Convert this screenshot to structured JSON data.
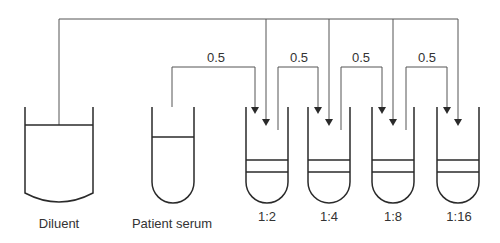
{
  "diagram": {
    "type": "serial-dilution",
    "containers": [
      {
        "id": "diluent",
        "label": "Diluent",
        "shape": "beaker"
      },
      {
        "id": "patient-serum",
        "label": "Patient serum",
        "shape": "test-tube"
      },
      {
        "id": "tube-1-2",
        "label": "1:2",
        "shape": "test-tube"
      },
      {
        "id": "tube-1-4",
        "label": "1:4",
        "shape": "test-tube"
      },
      {
        "id": "tube-1-8",
        "label": "1:8",
        "shape": "test-tube"
      },
      {
        "id": "tube-1-16",
        "label": "1:16",
        "shape": "test-tube"
      }
    ],
    "transfers": [
      {
        "from": "patient-serum",
        "to": "tube-1-2",
        "volume": "0.5"
      },
      {
        "from": "tube-1-2",
        "to": "tube-1-4",
        "volume": "0.5"
      },
      {
        "from": "tube-1-4",
        "to": "tube-1-8",
        "volume": "0.5"
      },
      {
        "from": "tube-1-8",
        "to": "tube-1-16",
        "volume": "0.5"
      }
    ],
    "diluent_distribution": {
      "from": "diluent",
      "to": [
        "tube-1-2",
        "tube-1-4",
        "tube-1-8",
        "tube-1-16"
      ]
    },
    "colors": {
      "line": "#2a2a2a",
      "connector": "#555555",
      "text": "#333333",
      "background": "#ffffff"
    }
  }
}
